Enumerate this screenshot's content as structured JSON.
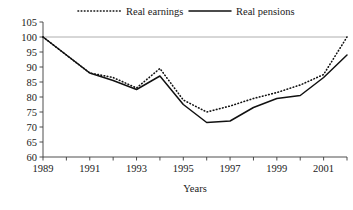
{
  "chart_data": {
    "type": "line",
    "title": "",
    "xlabel": "Years",
    "ylabel": "",
    "xlim": [
      1989,
      2002
    ],
    "ylim": [
      60,
      105
    ],
    "grid": false,
    "reference_line": 100,
    "legend_position": "top",
    "x": [
      1989,
      1990,
      1991,
      1992,
      1993,
      1994,
      1995,
      1996,
      1997,
      1998,
      1999,
      2000,
      2001,
      2002
    ],
    "xticks": [
      1989,
      1990,
      1991,
      1992,
      1993,
      1994,
      1995,
      1996,
      1997,
      1998,
      1999,
      2000,
      2001,
      2002
    ],
    "xtick_labels": [
      "1989",
      "",
      "1991",
      "",
      "1993",
      "",
      "1995",
      "",
      "1997",
      "",
      "1999",
      "",
      "2001",
      ""
    ],
    "yticks": [
      60,
      65,
      70,
      75,
      80,
      85,
      90,
      95,
      100,
      105
    ],
    "ytick_labels": [
      "60",
      "65",
      "70",
      "75",
      "80",
      "85",
      "90",
      "95",
      "100",
      "105"
    ],
    "series": [
      {
        "name": "Real earnings",
        "style": "dotted",
        "values": [
          100,
          94,
          88,
          86.5,
          83,
          89.5,
          79,
          75,
          77,
          79.5,
          81.5,
          84,
          87.5,
          100
        ]
      },
      {
        "name": "Real pensions",
        "style": "solid",
        "values": [
          100,
          94,
          88,
          85.5,
          82.5,
          87,
          77.5,
          71.5,
          72,
          76.5,
          79.5,
          80.5,
          86.5,
          94
        ]
      }
    ]
  },
  "legend": {
    "items": [
      {
        "label": "Real earnings",
        "marker": "dotted-line-marker"
      },
      {
        "label": "Real pensions",
        "marker": "solid-line-marker"
      }
    ]
  },
  "axes": {
    "x_title": "Years"
  }
}
